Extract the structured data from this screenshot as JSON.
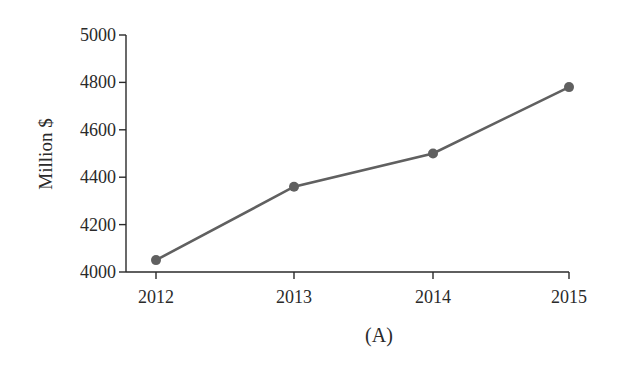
{
  "chart_data": {
    "type": "line",
    "title": "",
    "caption": "(A)",
    "xlabel": "",
    "ylabel": "Million $",
    "categories": [
      "2012",
      "2013",
      "2014",
      "2015"
    ],
    "series": [
      {
        "name": "Million $",
        "values": [
          4050,
          4360,
          4500,
          4780
        ],
        "color": "#606060"
      }
    ],
    "ylim": [
      4000,
      5000
    ],
    "yticks": [
      4000,
      4200,
      4400,
      4600,
      4800,
      5000
    ],
    "grid": false,
    "legend": null
  }
}
